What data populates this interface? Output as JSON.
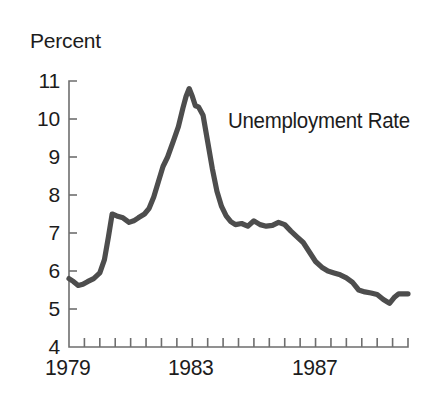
{
  "chart_data": {
    "type": "line",
    "title": "",
    "series_label": "Unemployment Rate",
    "ylabel": "Percent",
    "xlabel": "",
    "ylim": [
      4,
      11
    ],
    "xlim": [
      1979.0,
      1990.0
    ],
    "grid": false,
    "legend_position": "inline-annotation",
    "line_color": "#4d4d4d",
    "axis_color": "#6e6e6e",
    "text_color": "#1c1c1c",
    "background_color": "#ffffff",
    "ytick_labels": [
      "11",
      "10",
      "9",
      "8",
      "7",
      "6",
      "5",
      "4"
    ],
    "ytick_values": [
      11,
      10,
      9,
      8,
      7,
      6,
      5,
      4
    ],
    "xtick_labels": [
      "1979",
      "1983",
      "1987"
    ],
    "xtick_label_values": [
      1979,
      1983,
      1987
    ],
    "xtick_values": [
      1979.0,
      1979.5,
      1980.0,
      1980.5,
      1981.0,
      1981.5,
      1982.0,
      1982.5,
      1983.0,
      1983.5,
      1984.0,
      1984.5,
      1985.0,
      1985.5,
      1986.0,
      1986.5,
      1987.0,
      1987.5,
      1988.0,
      1988.5,
      1989.0,
      1989.5,
      1990.0
    ],
    "x": [
      1979.0,
      1979.15,
      1979.3,
      1979.45,
      1979.6,
      1979.8,
      1980.0,
      1980.15,
      1980.28,
      1980.4,
      1980.55,
      1980.75,
      1980.95,
      1981.1,
      1981.25,
      1981.45,
      1981.6,
      1981.75,
      1981.9,
      1982.05,
      1982.2,
      1982.4,
      1982.55,
      1982.7,
      1982.8,
      1982.9,
      1983.0,
      1983.1,
      1983.2,
      1983.35,
      1983.5,
      1983.65,
      1983.8,
      1983.95,
      1984.1,
      1984.25,
      1984.4,
      1984.6,
      1984.8,
      1985.0,
      1985.2,
      1985.4,
      1985.6,
      1985.8,
      1986.0,
      1986.2,
      1986.4,
      1986.6,
      1986.8,
      1987.0,
      1987.2,
      1987.4,
      1987.6,
      1987.8,
      1988.0,
      1988.2,
      1988.4,
      1988.6,
      1988.8,
      1989.0,
      1989.2,
      1989.4,
      1989.55,
      1989.7,
      1989.85,
      1990.0
    ],
    "y": [
      5.8,
      5.72,
      5.62,
      5.65,
      5.72,
      5.8,
      5.95,
      6.3,
      6.9,
      7.5,
      7.45,
      7.4,
      7.28,
      7.32,
      7.4,
      7.5,
      7.65,
      7.95,
      8.35,
      8.75,
      9.0,
      9.45,
      9.8,
      10.3,
      10.6,
      10.8,
      10.6,
      10.35,
      10.32,
      10.1,
      9.4,
      8.7,
      8.1,
      7.7,
      7.45,
      7.3,
      7.22,
      7.25,
      7.18,
      7.32,
      7.22,
      7.18,
      7.2,
      7.28,
      7.22,
      7.05,
      6.9,
      6.75,
      6.5,
      6.25,
      6.1,
      6.0,
      5.95,
      5.9,
      5.82,
      5.7,
      5.5,
      5.45,
      5.42,
      5.38,
      5.25,
      5.15,
      5.3,
      5.4,
      5.4,
      5.4
    ],
    "annotations": [
      {
        "text": "Unemployment Rate",
        "x": 1986.2,
        "y": 10.2
      },
      {
        "text": "Percent",
        "x": 1979.0,
        "y": 11.9
      }
    ],
    "peak": {
      "x": 1982.9,
      "y": 10.8,
      "label": "10.8"
    },
    "trough_start": {
      "x": 1979.3,
      "y": 5.62
    },
    "final_value": 5.4
  }
}
